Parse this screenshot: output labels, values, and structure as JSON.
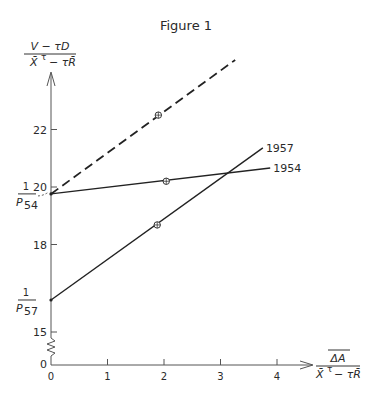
{
  "chart_data": {
    "type": "line",
    "title": "Figure 1",
    "ylabel": {
      "numerator": "V − τD",
      "denominator_a": "X̄",
      "denominator_sup": "τ",
      "denominator_b": "− τR̄"
    },
    "xlabel": {
      "numerator": "ΔA",
      "denominator_a": "X̄",
      "denominator_sup": "τ",
      "denominator_b": "− τR̄"
    },
    "xlim": [
      0,
      4.4
    ],
    "ylim_display": [
      15,
      23.6
    ],
    "axis_break": true,
    "x_ticks": [
      0,
      1,
      2,
      3,
      4
    ],
    "x_tick_labels": [
      "0",
      "1",
      "2",
      "3",
      "4"
    ],
    "y_ticks": [
      15,
      18,
      20,
      22
    ],
    "y_tick_labels": [
      "15",
      "18",
      "20",
      "22"
    ],
    "y_origin_label": "0",
    "grid": false,
    "intercept_labels": [
      {
        "numerator": "1",
        "denominator": "P",
        "subscript": "54",
        "value": 19.76
      },
      {
        "numerator": "1",
        "denominator": "P",
        "subscript": "57",
        "value": 16.07
      }
    ],
    "series": [
      {
        "name": "1954",
        "style": "solid",
        "x": [
          0,
          3.88
        ],
        "y": [
          19.76,
          20.66
        ],
        "marker": {
          "x": 2.04,
          "y": 20.2
        },
        "label": "1954"
      },
      {
        "name": "1957",
        "style": "solid",
        "x": [
          0,
          3.75
        ],
        "y": [
          16.07,
          21.36
        ],
        "marker": {
          "x": 1.88,
          "y": 18.68
        },
        "label": "1957"
      },
      {
        "name": "dashed",
        "style": "dashed",
        "x": [
          0,
          3.26
        ],
        "y": [
          19.76,
          24.42
        ],
        "marker": {
          "x": 1.9,
          "y": 22.5
        },
        "label": ""
      }
    ]
  }
}
